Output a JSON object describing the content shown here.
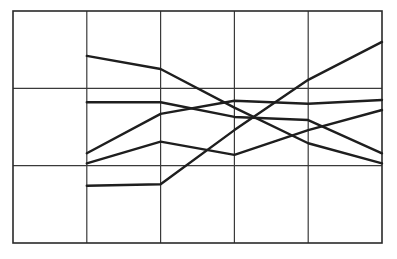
{
  "chart_data": {
    "type": "line",
    "title": "",
    "xlabel": "",
    "ylabel": "",
    "x": [
      1,
      2,
      3,
      4,
      5
    ],
    "x_range": [
      0,
      5
    ],
    "ylim": [
      0,
      3
    ],
    "grid": true,
    "legend": null,
    "series": [
      {
        "name": "Series 1",
        "values": [
          2.42,
          2.25,
          1.75,
          1.29,
          1.03
        ]
      },
      {
        "name": "Series 2",
        "values": [
          1.82,
          1.82,
          1.63,
          1.59,
          1.16
        ]
      },
      {
        "name": "Series 3",
        "values": [
          1.16,
          1.67,
          1.84,
          1.8,
          1.85
        ]
      },
      {
        "name": "Series 4",
        "values": [
          1.03,
          1.31,
          1.14,
          1.46,
          1.72
        ]
      },
      {
        "name": "Series 5",
        "values": [
          0.74,
          0.76,
          1.46,
          2.11,
          2.6
        ]
      }
    ],
    "line_color": "#1e1e1e",
    "grid_color": "#3a3a3a"
  }
}
